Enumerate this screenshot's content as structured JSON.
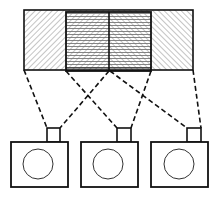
{
  "diagram": {
    "colors": {
      "stroke": "#111111",
      "hatch": "#888888",
      "background": "#ffffff"
    },
    "scene_strip": {
      "x": 24,
      "y": 10,
      "width": 169,
      "height": 60,
      "regions": [
        {
          "name": "left-field",
          "x": 24,
          "width": 42,
          "hatch": "diagonal-down"
        },
        {
          "name": "overlap-left",
          "x": 66,
          "width": 43,
          "hatch": "diagonal-down+horizontal"
        },
        {
          "name": "overlap-right",
          "x": 109,
          "width": 42,
          "hatch": "diagonal-up+horizontal"
        },
        {
          "name": "right-field",
          "x": 151,
          "width": 42,
          "hatch": "diagonal-up"
        }
      ],
      "overlap_box": {
        "x": 66,
        "y": 12,
        "width": 85,
        "height": 59
      }
    },
    "cameras": [
      {
        "name": "camera-left",
        "body": {
          "x": 11,
          "y": 142,
          "w": 57,
          "h": 45
        },
        "viewfinder": {
          "x": 47,
          "y": 128,
          "w": 13,
          "h": 14
        },
        "lens": {
          "cx": 38,
          "cy": 164,
          "r": 15
        }
      },
      {
        "name": "camera-middle",
        "body": {
          "x": 81,
          "y": 142,
          "w": 57,
          "h": 45
        },
        "viewfinder": {
          "x": 117,
          "y": 128,
          "w": 14,
          "h": 14
        },
        "lens": {
          "cx": 108,
          "cy": 164,
          "r": 15
        }
      },
      {
        "name": "camera-right",
        "body": {
          "x": 151,
          "y": 142,
          "w": 57,
          "h": 45
        },
        "viewfinder": {
          "x": 187,
          "y": 128,
          "w": 14,
          "h": 14
        },
        "lens": {
          "cx": 179,
          "cy": 164,
          "r": 15
        }
      }
    ],
    "fov_lines": [
      {
        "name": "left-cam-left-ray",
        "x1": 24,
        "y1": 70,
        "x2": 47,
        "y2": 128
      },
      {
        "name": "left-cam-right-ray",
        "x1": 109,
        "y1": 71,
        "x2": 60,
        "y2": 128
      },
      {
        "name": "middle-cam-left-ray",
        "x1": 66,
        "y1": 71,
        "x2": 117,
        "y2": 128
      },
      {
        "name": "middle-cam-right-ray",
        "x1": 151,
        "y1": 71,
        "x2": 131,
        "y2": 128
      },
      {
        "name": "right-cam-left-ray",
        "x1": 110,
        "y1": 71,
        "x2": 187,
        "y2": 128
      },
      {
        "name": "right-cam-right-ray",
        "x1": 193,
        "y1": 70,
        "x2": 201,
        "y2": 128
      }
    ]
  }
}
